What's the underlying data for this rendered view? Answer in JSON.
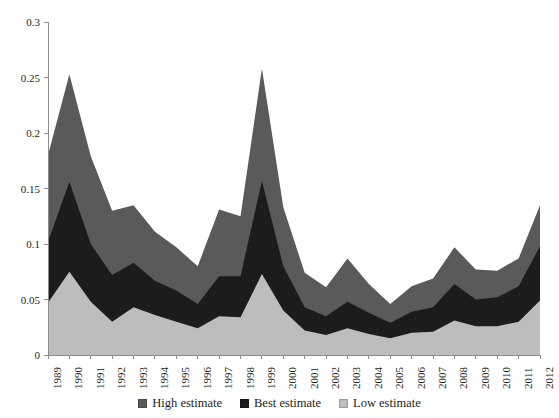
{
  "chart_data": {
    "type": "area",
    "stacked": true,
    "title": "",
    "xlabel": "",
    "ylabel": "",
    "ylim": [
      0,
      0.3
    ],
    "ytick_labels": [
      "0",
      "0.05",
      "0.1",
      "0.15",
      "0.2",
      "0.25",
      "0.3"
    ],
    "ytick_values": [
      0,
      0.05,
      0.1,
      0.15,
      0.2,
      0.25,
      0.3
    ],
    "grid": false,
    "legend_position": "bottom",
    "categories": [
      "1989",
      "1990",
      "1991",
      "1992",
      "1993",
      "1994",
      "1995",
      "1996",
      "1997",
      "1998",
      "1999",
      "2000",
      "2001",
      "2002",
      "2003",
      "2004",
      "2005",
      "2006",
      "2007",
      "2008",
      "2009",
      "2010",
      "2011",
      "2012"
    ],
    "series": [
      {
        "name": "Low estimate",
        "color": "#bdbdbd",
        "values": [
          0.047,
          0.075,
          0.048,
          0.03,
          0.043,
          0.036,
          0.03,
          0.024,
          0.035,
          0.034,
          0.073,
          0.04,
          0.022,
          0.018,
          0.024,
          0.019,
          0.015,
          0.02,
          0.021,
          0.031,
          0.026,
          0.026,
          0.03,
          0.049
        ]
      },
      {
        "name": "Best estimate",
        "color": "#1c1c1c",
        "values": [
          0.055,
          0.081,
          0.052,
          0.042,
          0.04,
          0.031,
          0.028,
          0.022,
          0.036,
          0.037,
          0.084,
          0.04,
          0.021,
          0.017,
          0.024,
          0.019,
          0.014,
          0.019,
          0.022,
          0.033,
          0.024,
          0.026,
          0.032,
          0.049
        ]
      },
      {
        "name": "High estimate",
        "color": "#5a5a5a",
        "values": [
          0.078,
          0.097,
          0.079,
          0.058,
          0.052,
          0.044,
          0.039,
          0.034,
          0.06,
          0.054,
          0.101,
          0.053,
          0.031,
          0.026,
          0.039,
          0.026,
          0.017,
          0.023,
          0.026,
          0.033,
          0.027,
          0.024,
          0.025,
          0.037
        ]
      }
    ],
    "stack_order_bottom_to_top": [
      "Low estimate",
      "Best estimate",
      "High estimate"
    ],
    "totals": [
      0.18,
      0.253,
      0.179,
      0.13,
      0.135,
      0.111,
      0.097,
      0.08,
      0.131,
      0.125,
      0.258,
      0.133,
      0.074,
      0.061,
      0.087,
      0.064,
      0.046,
      0.062,
      0.069,
      0.097,
      0.077,
      0.076,
      0.087,
      0.135
    ]
  },
  "legend": {
    "items": [
      {
        "label": "High estimate",
        "color": "#5a5a5a"
      },
      {
        "label": "Best estimate",
        "color": "#1c1c1c"
      },
      {
        "label": "Low estimate",
        "color": "#bdbdbd"
      }
    ]
  },
  "axes": {
    "axis_color": "#8c8c8c"
  }
}
